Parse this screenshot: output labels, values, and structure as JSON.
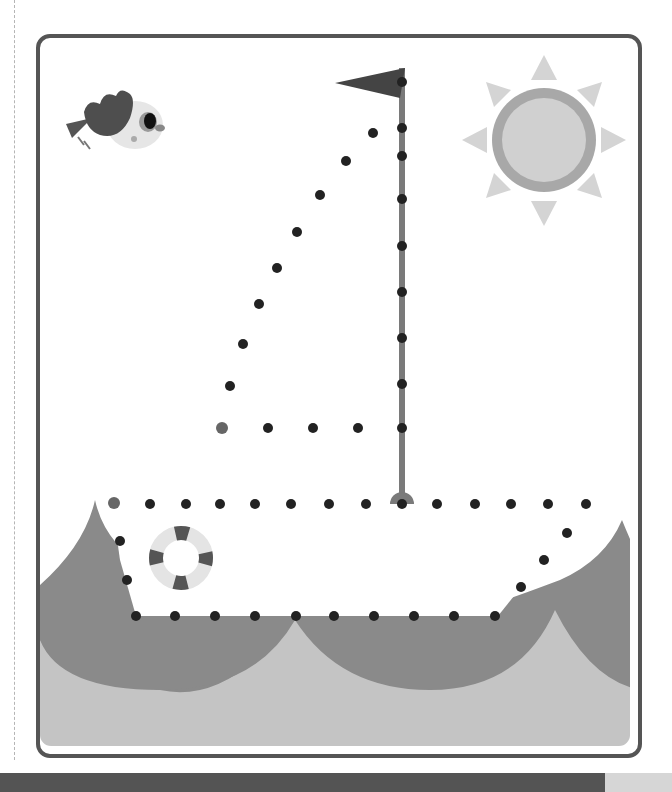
{
  "worksheet": {
    "type": "connect-the-dots",
    "subject": "sailboat",
    "colors": {
      "frame": "#555555",
      "dot": "#222222",
      "start_dot": "#666666",
      "sea_dark": "#8a8a8a",
      "sea_light": "#c4c4c4",
      "mast": "#7a7a7a",
      "flag": "#444444",
      "sun_ring": "#a8a8a8",
      "sun_core": "#d0d0d0",
      "sun_rays": "#d4d4d4",
      "bottom_bar": "#545454"
    },
    "decorations": [
      "bird",
      "sun",
      "flag",
      "life-ring",
      "waves"
    ],
    "sail_dots": [
      [
        373,
        133
      ],
      [
        346,
        161
      ],
      [
        320,
        195
      ],
      [
        297,
        232
      ],
      [
        277,
        268
      ],
      [
        259,
        304
      ],
      [
        243,
        344
      ],
      [
        230,
        386
      ],
      [
        222,
        428
      ],
      [
        268,
        428
      ],
      [
        313,
        428
      ],
      [
        358,
        428
      ]
    ],
    "mast_dots": [
      [
        402,
        82
      ],
      [
        402,
        128
      ],
      [
        402,
        156
      ],
      [
        402,
        199
      ],
      [
        402,
        246
      ],
      [
        402,
        292
      ],
      [
        402,
        338
      ],
      [
        402,
        384
      ],
      [
        402,
        428
      ]
    ],
    "hull_dots": [
      [
        114,
        503
      ],
      [
        150,
        504
      ],
      [
        186,
        504
      ],
      [
        220,
        504
      ],
      [
        255,
        504
      ],
      [
        291,
        504
      ],
      [
        329,
        504
      ],
      [
        366,
        504
      ],
      [
        402,
        504
      ],
      [
        437,
        504
      ],
      [
        475,
        504
      ],
      [
        511,
        504
      ],
      [
        548,
        504
      ],
      [
        586,
        504
      ],
      [
        567,
        533
      ],
      [
        544,
        560
      ],
      [
        521,
        587
      ],
      [
        495,
        616
      ],
      [
        454,
        616
      ],
      [
        414,
        616
      ],
      [
        374,
        616
      ],
      [
        334,
        616
      ],
      [
        296,
        616
      ],
      [
        255,
        616
      ],
      [
        215,
        616
      ],
      [
        175,
        616
      ],
      [
        136,
        616
      ],
      [
        127,
        580
      ],
      [
        120,
        541
      ]
    ]
  }
}
